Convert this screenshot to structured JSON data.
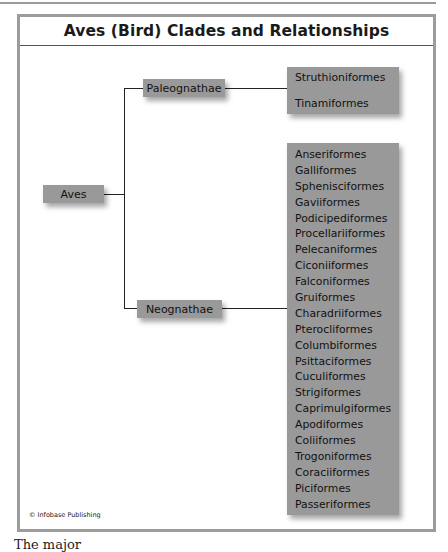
{
  "title": "Aves (Bird) Clades and Relationships",
  "root": {
    "label": "Aves"
  },
  "clades": [
    {
      "label": "Paleognathae",
      "orders": [
        "Struthioniformes",
        "Tinamiformes"
      ]
    },
    {
      "label": "Neognathae",
      "orders": [
        "Anseriformes",
        "Galliformes",
        "Sphenisciformes",
        "Gaviiformes",
        "Podicipediformes",
        "Procellariiformes",
        "Pelecaniformes",
        "Ciconiiformes",
        "Falconiformes",
        "Gruiformes",
        "Charadriiformes",
        "Pterocliformes",
        "Columbiformes",
        "Psittaciformes",
        "Cuculiformes",
        "Strigiformes",
        "Caprimulgiformes",
        "Apodiformes",
        "Coliiformes",
        "Trogoniformes",
        "Coraciiformes",
        "Piciformes",
        "Passeriformes"
      ]
    }
  ],
  "credit": "© Infobase Publishing",
  "caption_fragment": "The major",
  "colors": {
    "box_fill": "#999999",
    "frame": "#9c9c9c",
    "line": "#222222"
  }
}
